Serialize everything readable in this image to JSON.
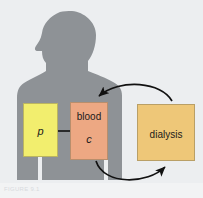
{
  "figure": {
    "domain_note": "textbook diagram: hemodialysis compartment model",
    "background_color": "#eceef0",
    "page_color": "#ffffff",
    "caption": "FIGURE 9.1"
  },
  "silhouette": {
    "name": "human-torso-silhouette",
    "color": "#8e9296",
    "facing": "left"
  },
  "boxes": [
    {
      "id": "plasma",
      "label": "p",
      "title": "",
      "color": "#f2ee6e",
      "x": 23,
      "y": 103,
      "w": 35,
      "h": 54
    },
    {
      "id": "blood",
      "label": "c",
      "title": "blood",
      "color": "#eda883",
      "x": 70,
      "y": 102,
      "w": 38,
      "h": 58
    },
    {
      "id": "dialysis",
      "label": "dialysis",
      "title": "",
      "color": "#eec778",
      "x": 137,
      "y": 104,
      "w": 58,
      "h": 57
    }
  ],
  "arrows": [
    {
      "id": "plasma-to-blood",
      "from": "p",
      "to": "c",
      "shape": "straight",
      "color": "#111111"
    },
    {
      "id": "dialysis-to-blood",
      "from": "dialysis",
      "to": "blood",
      "shape": "curved-top",
      "color": "#111111"
    },
    {
      "id": "blood-to-dialysis",
      "from": "blood",
      "to": "dialysis",
      "shape": "curved-bottom",
      "color": "#111111"
    }
  ]
}
